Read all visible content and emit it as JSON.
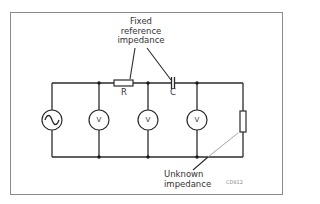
{
  "diagram": {
    "type": "circuit-schematic",
    "labels": {
      "fixed_ref_line1": "Fixed",
      "fixed_ref_line2": "reference",
      "fixed_ref_line3": "impedance",
      "resistor": "R",
      "capacitor": "C",
      "unknown_line1": "Unknown",
      "unknown_line2": "impedance",
      "figure_code": "CD912"
    },
    "components": [
      {
        "id": "ac-source",
        "symbol": "sine-icon"
      },
      {
        "id": "voltmeter-1",
        "label": "V"
      },
      {
        "id": "resistor-R",
        "label": "R"
      },
      {
        "id": "voltmeter-2",
        "label": "V"
      },
      {
        "id": "capacitor-C",
        "label": "C"
      },
      {
        "id": "voltmeter-3",
        "label": "V"
      },
      {
        "id": "unknown-impedance"
      }
    ],
    "colors": {
      "line": "#2b2b2b",
      "frame": "#8a8a8a",
      "background": "#ffffff"
    }
  }
}
